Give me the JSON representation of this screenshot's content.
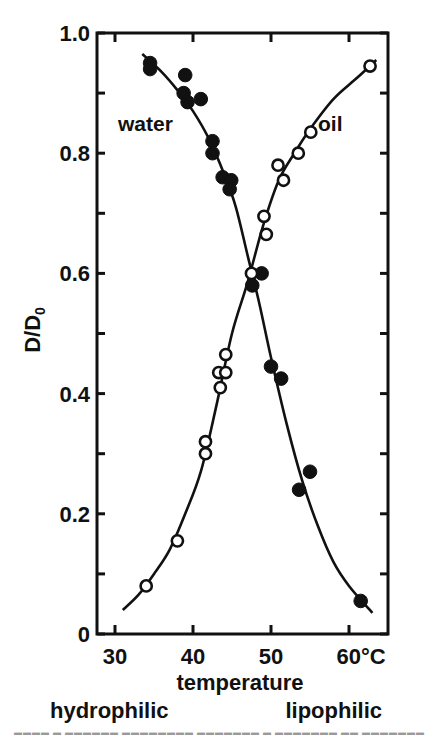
{
  "chart_data": {
    "type": "scatter",
    "title": "",
    "xlabel": "temperature",
    "xunit": "°C",
    "ylabel": "D/D0",
    "xlim": [
      27.5,
      64.5
    ],
    "ylim": [
      0,
      1.0
    ],
    "x_ticks": [
      30,
      40,
      50,
      60
    ],
    "x_tick_labels": [
      "30",
      "40",
      "50",
      "60°C"
    ],
    "y_ticks": [
      0,
      0.2,
      0.4,
      0.6,
      0.8,
      1.0
    ],
    "y_tick_labels": [
      "0",
      "0.2",
      "0.4",
      "0.6",
      "0.8",
      "1.0"
    ],
    "y_minor_step": 0.1,
    "grid": false,
    "annotations": {
      "left_bottom": "hydrophilic",
      "right_bottom": "lipophilic"
    },
    "series": [
      {
        "name": "water",
        "marker": "filled-circle",
        "points": [
          [
            34.5,
            0.95
          ],
          [
            34.5,
            0.94
          ],
          [
            39.0,
            0.93
          ],
          [
            38.8,
            0.9
          ],
          [
            39.3,
            0.885
          ],
          [
            41.0,
            0.89
          ],
          [
            42.5,
            0.82
          ],
          [
            42.5,
            0.8
          ],
          [
            43.8,
            0.76
          ],
          [
            44.9,
            0.755
          ],
          [
            44.7,
            0.74
          ],
          [
            48.8,
            0.6
          ],
          [
            47.6,
            0.58
          ],
          [
            50.0,
            0.445
          ],
          [
            51.3,
            0.425
          ],
          [
            55.0,
            0.27
          ],
          [
            53.6,
            0.24
          ],
          [
            61.5,
            0.055
          ]
        ],
        "curve": [
          [
            33.5,
            0.965
          ],
          [
            36,
            0.935
          ],
          [
            38,
            0.905
          ],
          [
            40,
            0.87
          ],
          [
            42,
            0.825
          ],
          [
            44,
            0.765
          ],
          [
            45.5,
            0.71
          ],
          [
            47,
            0.63
          ],
          [
            48.5,
            0.55
          ],
          [
            50,
            0.46
          ],
          [
            52,
            0.35
          ],
          [
            54,
            0.255
          ],
          [
            56,
            0.18
          ],
          [
            58,
            0.12
          ],
          [
            60,
            0.08
          ],
          [
            63,
            0.035
          ]
        ]
      },
      {
        "name": "oil",
        "marker": "open-circle",
        "points": [
          [
            34.0,
            0.08
          ],
          [
            38.0,
            0.155
          ],
          [
            41.6,
            0.32
          ],
          [
            41.6,
            0.3
          ],
          [
            43.5,
            0.41
          ],
          [
            43.3,
            0.435
          ],
          [
            44.2,
            0.435
          ],
          [
            44.2,
            0.465
          ],
          [
            47.5,
            0.6
          ],
          [
            49.1,
            0.695
          ],
          [
            49.4,
            0.665
          ],
          [
            50.9,
            0.78
          ],
          [
            51.6,
            0.755
          ],
          [
            53.5,
            0.8
          ],
          [
            55.1,
            0.835
          ],
          [
            62.7,
            0.945
          ]
        ],
        "curve": [
          [
            31,
            0.04
          ],
          [
            33,
            0.065
          ],
          [
            35,
            0.1
          ],
          [
            37,
            0.14
          ],
          [
            39,
            0.2
          ],
          [
            41,
            0.27
          ],
          [
            43,
            0.38
          ],
          [
            45,
            0.5
          ],
          [
            47,
            0.585
          ],
          [
            49,
            0.68
          ],
          [
            51,
            0.755
          ],
          [
            53,
            0.8
          ],
          [
            55,
            0.84
          ],
          [
            58,
            0.89
          ],
          [
            61,
            0.925
          ],
          [
            63.5,
            0.955
          ]
        ]
      }
    ]
  },
  "labels": {
    "ylabel_main": "D/D",
    "ylabel_sub": "0",
    "xlabel": "temperature",
    "water": "water",
    "oil": "oil",
    "hydrophilic": "hydrophilic",
    "lipophilic": "lipophilic"
  }
}
